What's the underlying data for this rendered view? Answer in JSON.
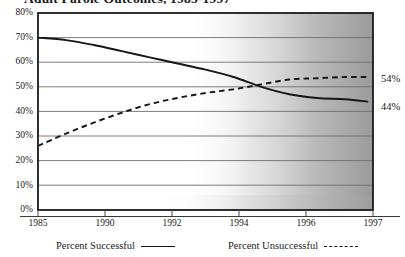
{
  "title": "Adult Parole Outcomes, 1985-1997",
  "end_labels": {
    "unsuccessful": "54%",
    "successful": "44%"
  },
  "legend": {
    "successful": "Percent Successful",
    "unsuccessful": "Percent Unsuccessful"
  },
  "colors": {
    "line": "#161616",
    "grid": "#6e6e6e",
    "axis": "#1a1a1a",
    "plot_bg": "#ffffff",
    "shade": "#9a9a9a"
  },
  "chart_data": {
    "type": "line",
    "title": "Adult Parole Outcomes, 1985-1997",
    "xlabel": "",
    "ylabel": "",
    "xlim": [
      1985,
      1997
    ],
    "ylim": [
      0,
      80
    ],
    "grid": true,
    "legend_position": "bottom",
    "xticks": [
      "1985",
      "1990",
      "1992",
      "1994",
      "1996",
      "1997"
    ],
    "xtick_values": [
      1985,
      1990,
      1992,
      1994,
      1996,
      1997
    ],
    "yticks": [
      "0%",
      "10%",
      "20%",
      "30%",
      "40%",
      "50%",
      "60%",
      "70%",
      "80%"
    ],
    "ytick_values": [
      0,
      10,
      20,
      30,
      40,
      50,
      60,
      70,
      80
    ],
    "x": [
      1985,
      1986,
      1987,
      1988,
      1989,
      1990,
      1991,
      1992,
      1993,
      1994,
      1995,
      1996,
      1996.8
    ],
    "series": [
      {
        "name": "Percent Successful",
        "style": "solid",
        "end_label": "44%",
        "values": [
          70,
          69,
          67,
          64.5,
          62,
          59.5,
          57,
          54,
          50,
          47,
          45.5,
          45,
          44
        ]
      },
      {
        "name": "Percent Unsuccessful",
        "style": "dashed",
        "end_label": "54%",
        "values": [
          26,
          31,
          35.5,
          39.5,
          43,
          45.5,
          47.5,
          49,
          51,
          53,
          53.5,
          54,
          54
        ]
      }
    ]
  }
}
